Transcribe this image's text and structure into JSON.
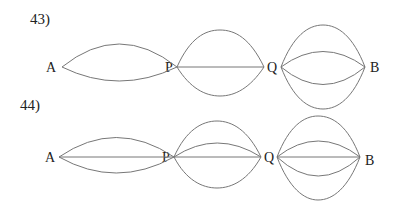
{
  "problems": [
    {
      "number_label": "43)",
      "vertices": [
        "A",
        "P",
        "Q",
        "B"
      ],
      "groups": [
        {
          "from": "A",
          "to": "P",
          "edges": 2,
          "straight": false
        },
        {
          "from": "P",
          "to": "Q",
          "edges": 3,
          "straight": true
        },
        {
          "from": "Q",
          "to": "B",
          "edges": 4,
          "straight": false
        }
      ]
    },
    {
      "number_label": "44)",
      "vertices": [
        "A",
        "P",
        "Q",
        "B"
      ],
      "groups": [
        {
          "from": "A",
          "to": "P",
          "edges": 3,
          "straight": true
        },
        {
          "from": "P",
          "to": "Q",
          "edges": 4,
          "straight": true
        },
        {
          "from": "Q",
          "to": "B",
          "edges": 5,
          "straight": true
        }
      ]
    }
  ]
}
